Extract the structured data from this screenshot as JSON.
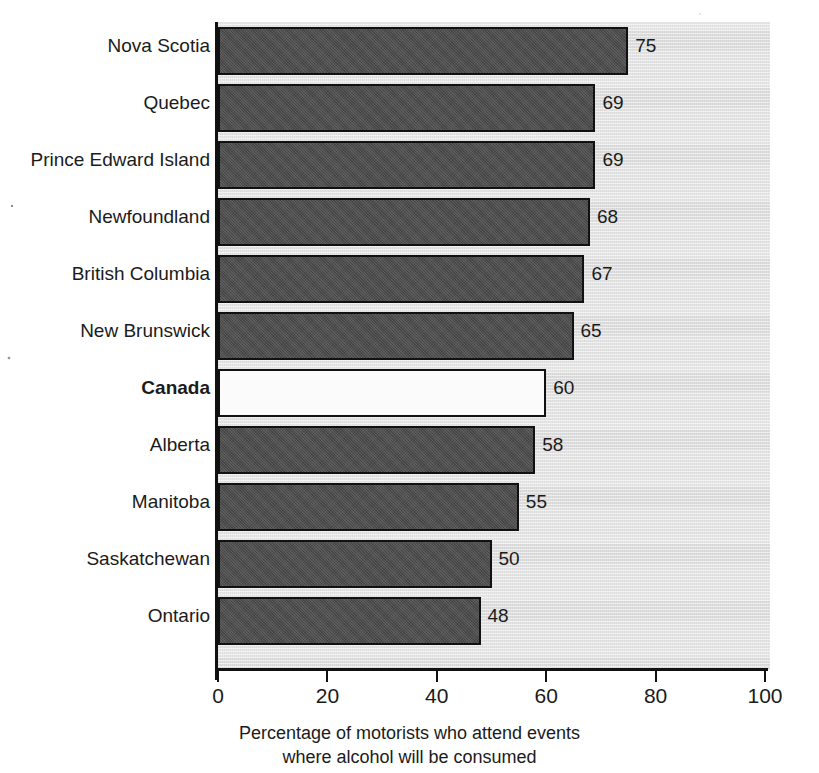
{
  "chart_data": {
    "type": "bar",
    "orientation": "horizontal",
    "title": "",
    "xlabel": "Percentage of motorists who attend events where alcohol will be consumed",
    "ylabel": "",
    "xlim": [
      0,
      100
    ],
    "xticks": [
      0,
      20,
      40,
      60,
      80,
      100
    ],
    "xtick_labels": [
      "0",
      "20",
      "40",
      "60",
      "80",
      "100"
    ],
    "grid": false,
    "legend": false,
    "categories": [
      "Nova Scotia",
      "Quebec",
      "Prince Edward Island",
      "Newfoundland",
      "British Columbia",
      "New Brunswick",
      "Canada",
      "Alberta",
      "Manitoba",
      "Saskatchewan",
      "Ontario"
    ],
    "values": [
      75,
      69,
      69,
      68,
      67,
      65,
      60,
      58,
      55,
      50,
      48
    ],
    "value_labels": [
      "75",
      "69",
      "69",
      "68",
      "67",
      "65",
      "60",
      "58",
      "55",
      "50",
      "48"
    ],
    "highlighted_category": "Canada",
    "bars": [
      {
        "category": "Nova Scotia",
        "value": 75,
        "label": "75",
        "style": "filled",
        "bold": false
      },
      {
        "category": "Quebec",
        "value": 69,
        "label": "69",
        "style": "filled",
        "bold": false
      },
      {
        "category": "Prince Edward Island",
        "value": 69,
        "label": "69",
        "style": "filled",
        "bold": false
      },
      {
        "category": "Newfoundland",
        "value": 68,
        "label": "68",
        "style": "filled",
        "bold": false
      },
      {
        "category": "British Columbia",
        "value": 67,
        "label": "67",
        "style": "filled",
        "bold": false
      },
      {
        "category": "New Brunswick",
        "value": 65,
        "label": "65",
        "style": "filled",
        "bold": false
      },
      {
        "category": "Canada",
        "value": 60,
        "label": "60",
        "style": "open",
        "bold": true
      },
      {
        "category": "Alberta",
        "value": 58,
        "label": "58",
        "style": "filled",
        "bold": false
      },
      {
        "category": "Manitoba",
        "value": 55,
        "label": "55",
        "style": "filled",
        "bold": false
      },
      {
        "category": "Saskatchewan",
        "value": 50,
        "label": "50",
        "style": "filled",
        "bold": false
      },
      {
        "category": "Ontario",
        "value": 48,
        "label": "48",
        "style": "filled",
        "bold": false
      }
    ]
  },
  "caption": {
    "line1": "Percentage of motorists who attend events",
    "line2": "where alcohol will be consumed"
  },
  "colors": {
    "bar_fill": "#4c4c4c",
    "bar_outline": "#111111",
    "bar_open_fill": "#fbfbfb",
    "plot_background": "#e4e4e4",
    "axis": "#111111",
    "text": "#1b1b1b",
    "page_background": "#ffffff"
  }
}
